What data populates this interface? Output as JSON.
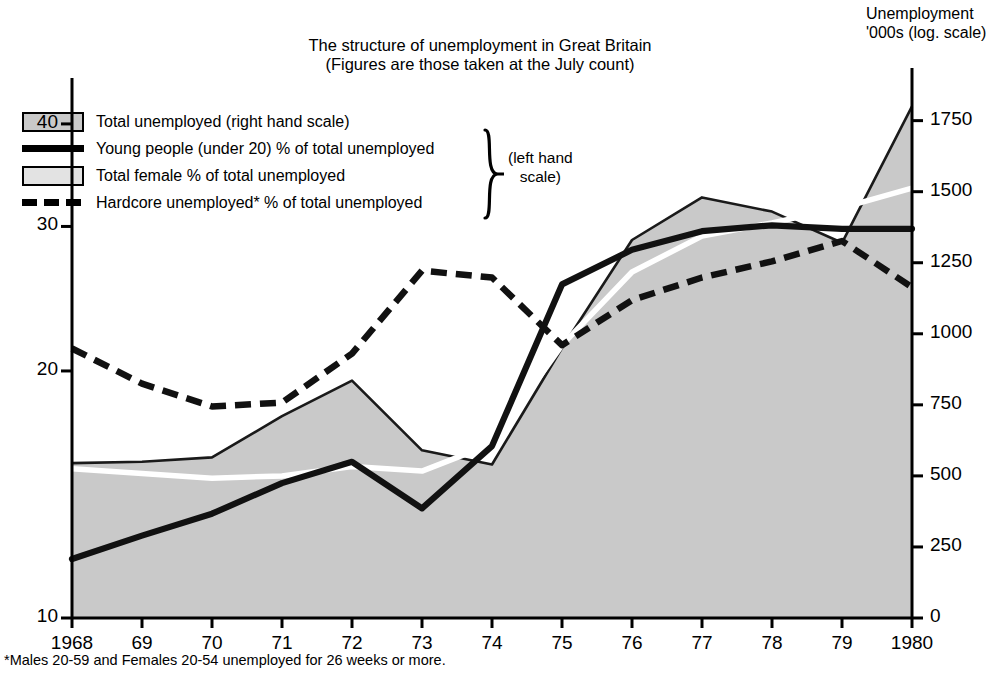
{
  "title": {
    "line1": "The structure of unemployment in Great Britain",
    "line2": "(Figures are those taken at the July count)"
  },
  "right_axis_title": {
    "line1": "Unemployment",
    "line2": "'000s  (log. scale)"
  },
  "left_axis_title": {
    "line1": "% of total",
    "line2": "unemployed",
    "line3": "(log. scale)"
  },
  "footnote": "*Males 20-59 and Females 20-54 unemployed for 26 weeks or more.",
  "legend": {
    "items": [
      {
        "label": "Total unemployed (right hand scale)",
        "marker": "area-swatch-dark"
      },
      {
        "label": "Young people (under 20) % of total unemployed",
        "marker": "solid-line"
      },
      {
        "label": "Total female % of total unemployed",
        "marker": "area-swatch-light"
      },
      {
        "label": "Hardcore unemployed* % of total unemployed",
        "marker": "dashed-line"
      }
    ],
    "bracket_label_line1": "(left hand",
    "bracket_label_line2": "scale)"
  },
  "colors": {
    "area_fill": "#c9c9c9",
    "line_dark": "#1a1a1a",
    "line_white": "#ffffff",
    "axis": "#000000",
    "background": "#ffffff"
  },
  "chart_data": {
    "type": "line",
    "title": "The structure of unemployment in Great Britain",
    "subtitle": "(Figures are those taken at the July count)",
    "xlabel": "",
    "grid": false,
    "legend_position": "top-left",
    "x": [
      1968,
      1969,
      1970,
      1971,
      1972,
      1973,
      1974,
      1975,
      1976,
      1977,
      1978,
      1979,
      1980
    ],
    "xtick_labels": [
      "1968",
      "69",
      "70",
      "71",
      "72",
      "73",
      "74",
      "75",
      "76",
      "77",
      "78",
      "79",
      "1980"
    ],
    "left_axis": {
      "label": "% of total unemployed (log. scale)",
      "scale": "log",
      "ticks": [
        10,
        20,
        30,
        40
      ],
      "ylim": [
        10,
        45
      ]
    },
    "right_axis": {
      "label": "Unemployment '000s (log. scale)",
      "scale": "log",
      "ticks": [
        0,
        250,
        500,
        750,
        1000,
        1250,
        1500,
        1750
      ],
      "ylim": [
        0,
        1900
      ]
    },
    "series": [
      {
        "name": "Total unemployed (right hand scale)",
        "axis": "right",
        "style": "filled-area",
        "units": "'000s",
        "values": [
          545,
          550,
          565,
          710,
          835,
          590,
          540,
          950,
          1330,
          1480,
          1430,
          1320,
          1800
        ]
      },
      {
        "name": "Young people (under 20) % of total unemployed",
        "axis": "left",
        "style": "solid-thick",
        "units": "%",
        "values": [
          11.8,
          12.6,
          13.4,
          14.6,
          15.5,
          13.6,
          16.2,
          25.5,
          28.1,
          29.6,
          30.1,
          29.8,
          29.8
        ]
      },
      {
        "name": "Total female % of total unemployed",
        "axis": "left",
        "style": "solid-white",
        "units": "%",
        "values": [
          15.2,
          15.0,
          14.8,
          14.9,
          15.3,
          15.1,
          16.3,
          21.5,
          26.4,
          29.2,
          30.3,
          31.6,
          33.4
        ]
      },
      {
        "name": "Hardcore unemployed* % of total unemployed",
        "axis": "left",
        "style": "dashed-thick",
        "units": "%",
        "values": [
          21.3,
          19.3,
          18.1,
          18.3,
          21.0,
          26.5,
          26.0,
          21.5,
          24.4,
          26.0,
          27.2,
          28.8,
          25.3
        ]
      }
    ],
    "notes": "*Males 20-59 and Females 20-54 unemployed for 26 weeks or more."
  }
}
